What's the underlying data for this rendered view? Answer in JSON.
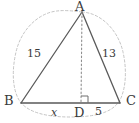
{
  "figure": {
    "type": "geometry-diagram",
    "background_color": "#ffffff",
    "solid_stroke_color": "#5a5a5a",
    "dashed_stroke_color": "#b9b9b9",
    "dotted_stroke_color": "#8f8f8f",
    "label_color": "#3a3a3a"
  },
  "vertices": {
    "A": {
      "label": "A",
      "x": 82,
      "y": 12,
      "label_x": 77,
      "label_y": 1
    },
    "B": {
      "label": "B",
      "x": 21,
      "y": 103,
      "label_x": 6,
      "label_y": 96
    },
    "C": {
      "label": "C",
      "x": 120,
      "y": 103,
      "label_x": 126,
      "label_y": 96
    },
    "D": {
      "label": "D",
      "x": 81,
      "y": 103,
      "label_x": 76,
      "label_y": 108
    }
  },
  "segments": [
    {
      "name": "AB",
      "from": "A",
      "to": "B",
      "style": "solid",
      "measure": "15"
    },
    {
      "name": "AC",
      "from": "A",
      "to": "C",
      "style": "solid",
      "measure": "13"
    },
    {
      "name": "BC",
      "from": "B",
      "to": "C",
      "style": "solid",
      "measure": ""
    },
    {
      "name": "AD",
      "from": "A",
      "to": "D",
      "style": "dotted",
      "measure": ""
    }
  ],
  "measures": {
    "side_ab": {
      "text": "15",
      "x": 31,
      "y": 53
    },
    "side_ac": {
      "text": "13",
      "x": 105,
      "y": 53
    },
    "segment_bd": {
      "text": "x",
      "x": 53,
      "y": 108
    },
    "segment_dc": {
      "text": "5",
      "x": 96,
      "y": 108
    }
  },
  "markers": {
    "right_angle": {
      "name": "right-angle-marker",
      "at_vertex": "D",
      "size": 7,
      "orientation": "up-right"
    }
  },
  "circumscribed_ellipse": {
    "name": "circumscribed-ellipse",
    "style": "dashed",
    "center_x": 70,
    "center_y": 62,
    "radius_x": 56,
    "radius_y": 51
  }
}
